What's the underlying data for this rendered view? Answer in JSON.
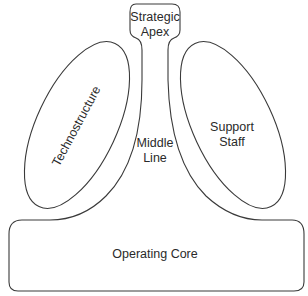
{
  "diagram": {
    "type": "organizational-structure",
    "parts": {
      "strategic_apex": {
        "line1": "Strategic",
        "line2": "Apex"
      },
      "technostructure": {
        "label": "Technostructure"
      },
      "support_staff": {
        "line1": "Support",
        "line2": "Staff"
      },
      "middle_line": {
        "line1": "Middle",
        "line2": "Line"
      },
      "operating_core": {
        "label": "Operating Core"
      }
    },
    "colors": {
      "stroke": "#3a3a3a",
      "text": "#2a2a2a",
      "background": "#ffffff"
    }
  }
}
